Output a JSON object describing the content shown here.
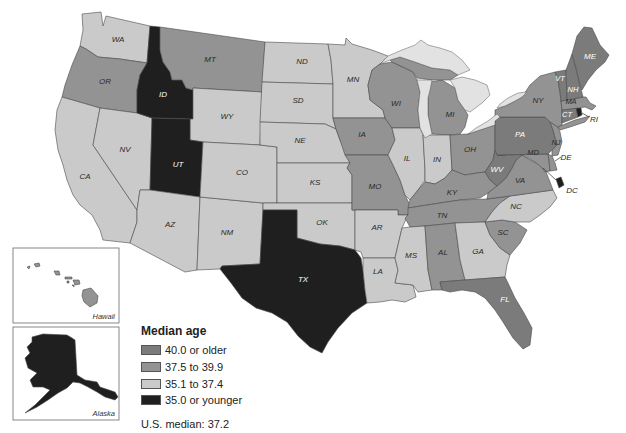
{
  "legend": {
    "title": "Median age",
    "items": [
      {
        "label": "40.0 or older",
        "color": "#7b7b7b"
      },
      {
        "label": "37.5 to 39.9",
        "color": "#939393"
      },
      {
        "label": "35.1 to 37.4",
        "color": "#cacaca"
      },
      {
        "label": "35.0 or younger",
        "color": "#1f1f1f"
      }
    ],
    "note": "U.S. median: 37.2"
  },
  "insets": {
    "hawaii": {
      "label": "Hawaii",
      "bracket": 1
    },
    "alaska": {
      "label": "Alaska",
      "bracket": 3
    }
  },
  "colors": {
    "lakes": "#e2e2e2",
    "label_on_light": "#2a2a2a",
    "label_on_dark": "#ffffff",
    "callout_text": "#2a2a2a"
  },
  "states": [
    {
      "code": "WA",
      "bracket": 2
    },
    {
      "code": "OR",
      "bracket": 1
    },
    {
      "code": "CA",
      "bracket": 2
    },
    {
      "code": "NV",
      "bracket": 2
    },
    {
      "code": "ID",
      "bracket": 3
    },
    {
      "code": "MT",
      "bracket": 1
    },
    {
      "code": "WY",
      "bracket": 2
    },
    {
      "code": "UT",
      "bracket": 3
    },
    {
      "code": "AZ",
      "bracket": 2
    },
    {
      "code": "NM",
      "bracket": 2
    },
    {
      "code": "CO",
      "bracket": 2
    },
    {
      "code": "ND",
      "bracket": 2
    },
    {
      "code": "SD",
      "bracket": 2
    },
    {
      "code": "NE",
      "bracket": 2
    },
    {
      "code": "KS",
      "bracket": 2
    },
    {
      "code": "OK",
      "bracket": 2
    },
    {
      "code": "TX",
      "bracket": 3
    },
    {
      "code": "MN",
      "bracket": 2
    },
    {
      "code": "IA",
      "bracket": 1
    },
    {
      "code": "MO",
      "bracket": 1
    },
    {
      "code": "AR",
      "bracket": 2
    },
    {
      "code": "LA",
      "bracket": 2
    },
    {
      "code": "WI",
      "bracket": 1
    },
    {
      "code": "IL",
      "bracket": 2
    },
    {
      "code": "MI",
      "bracket": 1
    },
    {
      "code": "IN",
      "bracket": 2
    },
    {
      "code": "OH",
      "bracket": 1
    },
    {
      "code": "KY",
      "bracket": 1
    },
    {
      "code": "TN",
      "bracket": 1
    },
    {
      "code": "MS",
      "bracket": 2
    },
    {
      "code": "AL",
      "bracket": 1
    },
    {
      "code": "GA",
      "bracket": 2
    },
    {
      "code": "FL",
      "bracket": 0
    },
    {
      "code": "SC",
      "bracket": 1
    },
    {
      "code": "NC",
      "bracket": 2
    },
    {
      "code": "VA",
      "bracket": 1
    },
    {
      "code": "WV",
      "bracket": 0
    },
    {
      "code": "MD",
      "bracket": 1
    },
    {
      "code": "DE",
      "bracket": 1
    },
    {
      "code": "PA",
      "bracket": 0
    },
    {
      "code": "NJ",
      "bracket": 1
    },
    {
      "code": "NY",
      "bracket": 1
    },
    {
      "code": "CT",
      "bracket": 0
    },
    {
      "code": "RI",
      "bracket": 3
    },
    {
      "code": "MA",
      "bracket": 1
    },
    {
      "code": "VT",
      "bracket": 0
    },
    {
      "code": "NH",
      "bracket": 0
    },
    {
      "code": "ME",
      "bracket": 0
    },
    {
      "code": "DC",
      "bracket": 3
    }
  ]
}
